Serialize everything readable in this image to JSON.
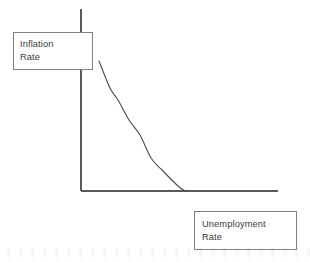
{
  "diagram": {
    "kind": "phillips-curve",
    "background_color": "#ffffff",
    "line_color": "#5a5a5a",
    "curve_color": "#4a4a4a",
    "box_border_color": "#808080",
    "text_color": "#3b3b3b"
  },
  "y_axis_label": {
    "line1": "Inflation",
    "line2": "Rate"
  },
  "x_axis_label": {
    "line1": "Unemployment",
    "line2": "Rate"
  },
  "chart_data": {
    "type": "line",
    "title": "",
    "xlabel": "Unemployment Rate",
    "ylabel": "Inflation Rate",
    "grid": false,
    "legend": "none",
    "axis_ticks": [],
    "annotations": [],
    "series": [
      {
        "name": "Phillips Curve",
        "shape": "convex-decreasing",
        "x": [
          0.09,
          0.15,
          0.19,
          0.25,
          0.31,
          0.37,
          0.43,
          0.5,
          0.53
        ],
        "y": [
          0.71,
          0.56,
          0.47,
          0.37,
          0.29,
          0.21,
          0.14,
          0.04,
          0.0
        ],
        "points_px": [
          [
            99,
            61
          ],
          [
            110,
            88
          ],
          [
            118,
            100
          ],
          [
            129,
            120
          ],
          [
            140,
            135
          ],
          [
            151,
            158
          ],
          [
            162,
            170
          ],
          [
            178,
            186
          ],
          [
            185,
            191
          ]
        ]
      }
    ],
    "axes_px": {
      "origin": [
        81,
        191
      ],
      "y_axis_top": [
        81,
        9
      ],
      "x_axis_right": [
        278,
        191
      ]
    }
  }
}
